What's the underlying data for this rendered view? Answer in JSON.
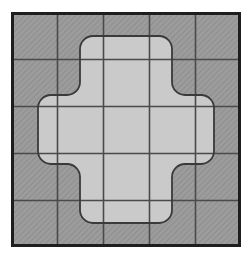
{
  "figure": {
    "title": "Hatched square grid with inscribed rounded cross",
    "canvas": {
      "width": 251,
      "height": 259,
      "background": "#ffffff"
    },
    "colors": {
      "hatch_fill": "#9c9c9c",
      "hatch_line": "#8a8a8a",
      "cross_fill": "#cacaca",
      "grid_line": "#4a4a4a",
      "outer_border": "#1e1e1e",
      "cross_outline": "#3a3a3a",
      "background": "#ffffff"
    },
    "outer_square": {
      "label": "outer-square",
      "x": 11,
      "y": 12,
      "width": 230,
      "height": 235,
      "border_width": 3,
      "fill": "hatched"
    },
    "grid": {
      "label": "grid",
      "rows": 5,
      "columns": 5,
      "cell_width": 46,
      "cell_height": 47,
      "line_width": 1.6,
      "vertical_lines_x": [
        57,
        103,
        149,
        195
      ],
      "horizontal_lines_y": [
        59,
        106,
        153,
        200
      ]
    },
    "hatching": {
      "label": "diagonal-hatch",
      "angle_degrees": 45,
      "spacing": 3,
      "stroke_width": 1
    },
    "cross": {
      "label": "rounded-cross",
      "description": "Plus / Greek cross made of 5 grid cells wide by 5 tall with 3-cell-wide arms, corners rounded",
      "arm_width_cells": 1,
      "span_cells": 3,
      "corner_radius_outer": 13,
      "corner_radius_inner": 13,
      "left": 38,
      "top": 36,
      "right": 214,
      "bottom": 223,
      "inner_left": 80,
      "inner_right": 172,
      "inner_top": 82,
      "inner_bottom": 177,
      "outline_width": 1.8,
      "fill": "#cacaca"
    }
  }
}
